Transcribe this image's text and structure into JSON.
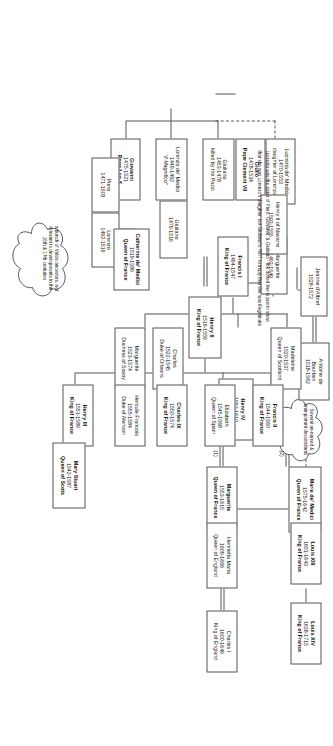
{
  "diagram": {
    "type": "genealogy-family-tree",
    "notes": {
      "lucrezia_note_line1": "Lucrezia was the sister of Piero, Giovanni, & Giuliano - the dotted line is just to show",
      "lucrezia_note_line2": "that she was Lorenzo's daughter, not Giuliano's. NOT to imply that she was illegitimate",
      "cloud_valois": "a bunch of Valois ancestors, not relevant to developments in the 16th & 17th centuries",
      "cloud_descendants": "Several un-named & unimportant descendants"
    },
    "marriage_tags": {
      "first": "(1)",
      "second": "(2)"
    },
    "people": [
      {
        "id": "lorenzo_magnifico",
        "name": "Lorenzo de' Medici",
        "dates": "1449-1492",
        "title": "“Il Magnifico”",
        "bold": false,
        "italic_title": true
      },
      {
        "id": "giuliano_pazzi",
        "name": "Giuliano",
        "dates": "1453-1478",
        "title": "killed by the Pazzi",
        "bold": false
      },
      {
        "id": "giulio_clement",
        "name": "Giulio",
        "dates": "1478-1534",
        "title": "Pope Clement VII",
        "bold": true
      },
      {
        "id": "giovanni_leox",
        "name": "Giovanni",
        "dates": "1475-1521",
        "title": "Pope Leo X",
        "bold": true
      },
      {
        "id": "giuliano_1479",
        "name": "Giuliano",
        "dates": "1479-1516",
        "title": "",
        "bold": false
      },
      {
        "id": "piero",
        "name": "Piero",
        "dates": "1471-1503",
        "title": "",
        "bold": false
      },
      {
        "id": "lorenzo_1492",
        "name": "Lorenzo",
        "dates": "1492-1519",
        "title": "",
        "bold": false
      },
      {
        "id": "lucrezia",
        "name": "Lucrezia de' Medici",
        "dates": "1470-1553",
        "title": "daughter of Lorenzo",
        "bold": false
      },
      {
        "id": "catherine",
        "name": "Catherine de' Medici",
        "dates": "1519-1589",
        "title": "Queen of France",
        "bold": true
      },
      {
        "id": "henry_ii",
        "name": "Henry II",
        "dates": "1519-1559",
        "title": "King of France",
        "bold": true
      },
      {
        "id": "francis_i",
        "name": "Francis I",
        "dates": "1494-1547",
        "title": "King of France",
        "bold": true
      },
      {
        "id": "marguerite_1492",
        "name": "Marguerite",
        "dates": "1492-1549",
        "title": "",
        "bold": false
      },
      {
        "id": "henry_ii_navarre",
        "name": "Henry II of Navarre",
        "dates": "1503-1555",
        "title": "",
        "bold": false
      },
      {
        "id": "jeanne_albret",
        "name": "Jeanne d'Albret",
        "dates": "1528-1572",
        "title": "",
        "bold": false
      },
      {
        "id": "antoine_bourbon",
        "name": "Antoine de",
        "dates": "1518-1562",
        "title": "Bourbon",
        "bold": true
      },
      {
        "id": "henry_iv",
        "name": "Henry IV",
        "dates": "1553-1610",
        "title": "King of France",
        "bold": true
      },
      {
        "id": "marguerite_1553",
        "name": "Marguerite",
        "dates": "1553-1615",
        "title": "Queen of France",
        "bold": true
      },
      {
        "id": "marie_medici",
        "name": "Marie de' Medici",
        "dates": "1575-1642",
        "title": "Queen of France",
        "bold": true
      },
      {
        "id": "louis_xiii",
        "name": "Louis XIII",
        "dates": "1601-1643",
        "title": "King of France",
        "bold": true
      },
      {
        "id": "louis_xiv",
        "name": "Louis XIV",
        "dates": "1638-1715",
        "title": "King of France",
        "bold": true
      },
      {
        "id": "henrietta_maria",
        "name": "Henrietta Maria",
        "dates": "1609-1669",
        "title": "Queen of England",
        "bold": false
      },
      {
        "id": "charles_i",
        "name": "Charles I",
        "dates": "1600-1649",
        "title": "King of England",
        "bold": false
      },
      {
        "id": "madeleine",
        "name": "Madeleine",
        "dates": "1520-1537",
        "title": "Queen of Scotland",
        "bold": false
      },
      {
        "id": "charles_orleans",
        "name": "Charles",
        "dates": "1522-1545",
        "title": "Duke of Orleans",
        "bold": false
      },
      {
        "id": "marguerite_savoy",
        "name": "Marguerite",
        "dates": "1523-1574",
        "title": "Duchess of Savoy",
        "bold": false
      },
      {
        "id": "hercule",
        "name": "Hercule Francois",
        "dates": "1555-1584",
        "title": "Duke of Alencon",
        "bold": false
      },
      {
        "id": "henry_iii",
        "name": "Henry III",
        "dates": "1551-1589",
        "title": "King of France",
        "bold": true
      },
      {
        "id": "charles_ix",
        "name": "Charles IX",
        "dates": "1550-1574",
        "title": "King of France",
        "bold": true
      },
      {
        "id": "elizabeth_spain",
        "name": "Elizabeth",
        "dates": "1545-1568",
        "title": "Queen of Spain",
        "bold": false
      },
      {
        "id": "francis_ii",
        "name": "Francis II",
        "dates": "1544-1560",
        "title": "King of France",
        "bold": true
      },
      {
        "id": "mary_stuart",
        "name": "Mary Stuart",
        "dates": "1542-1587",
        "title": "Queen of Scots",
        "bold": true
      }
    ]
  }
}
